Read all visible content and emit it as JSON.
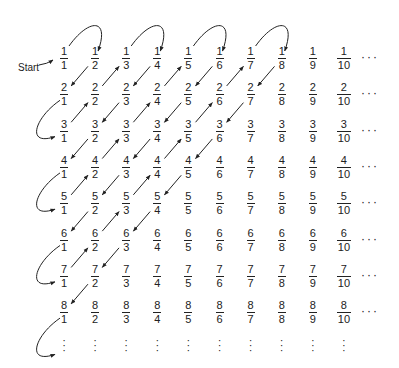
{
  "start_label": "Start",
  "numerators": [
    1,
    2,
    3,
    4,
    5,
    6,
    7,
    8
  ],
  "denominators": [
    1,
    2,
    3,
    4,
    5,
    6,
    7,
    8,
    9,
    10
  ],
  "row_ellipsis": "···",
  "vertical_ellipsis": "⋮",
  "path": [
    [
      1,
      1
    ],
    [
      1,
      2
    ],
    [
      2,
      1
    ],
    [
      3,
      1
    ],
    [
      2,
      2
    ],
    [
      1,
      3
    ],
    [
      1,
      4
    ],
    [
      2,
      3
    ],
    [
      3,
      2
    ],
    [
      4,
      1
    ],
    [
      5,
      1
    ],
    [
      4,
      2
    ],
    [
      3,
      3
    ],
    [
      2,
      4
    ],
    [
      1,
      5
    ],
    [
      1,
      6
    ],
    [
      2,
      5
    ],
    [
      3,
      4
    ],
    [
      4,
      3
    ],
    [
      5,
      2
    ],
    [
      6,
      1
    ],
    [
      7,
      1
    ],
    [
      6,
      2
    ],
    [
      5,
      3
    ],
    [
      4,
      4
    ],
    [
      3,
      5
    ],
    [
      2,
      6
    ],
    [
      1,
      7
    ],
    [
      1,
      8
    ],
    [
      2,
      7
    ],
    [
      3,
      6
    ],
    [
      4,
      5
    ],
    [
      5,
      4
    ],
    [
      6,
      3
    ],
    [
      7,
      2
    ],
    [
      8,
      1
    ],
    [
      9,
      1
    ]
  ],
  "colors": {
    "ink": "#222222",
    "background": "#ffffff"
  }
}
